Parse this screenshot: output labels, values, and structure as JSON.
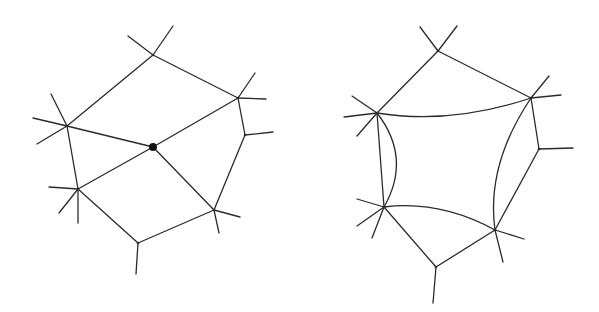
{
  "diagram": {
    "stroke_color": "#2a2a2a",
    "background": "#ffffff",
    "figures": [
      {
        "name": "left-graph",
        "vertices": {
          "top": [
            153,
            55
          ],
          "right_upper": [
            238,
            98
          ],
          "right_mid": [
            245,
            135
          ],
          "center": [
            153,
            147
          ],
          "left_upper": [
            67,
            126
          ],
          "left_lower": [
            78,
            189
          ],
          "bottom_right": [
            214,
            210
          ],
          "bottom": [
            138,
            243
          ]
        },
        "center_dot_radius": 4,
        "edges": [
          [
            "top",
            "right_upper"
          ],
          [
            "top",
            "left_upper"
          ],
          [
            "right_upper",
            "right_mid"
          ],
          [
            "right_mid",
            "bottom_right"
          ],
          [
            "right_upper",
            "center"
          ],
          [
            "left_upper",
            "center"
          ],
          [
            "left_lower",
            "center"
          ],
          [
            "bottom_right",
            "center"
          ],
          [
            "left_upper",
            "left_lower"
          ],
          [
            "left_lower",
            "bottom"
          ],
          [
            "bottom",
            "bottom_right"
          ]
        ],
        "stubs": [
          [
            [
              153,
              55
            ],
            [
              173,
              26
            ]
          ],
          [
            [
              153,
              55
            ],
            [
              128,
              36
            ]
          ],
          [
            [
              238,
              98
            ],
            [
              255,
              73
            ]
          ],
          [
            [
              238,
              98
            ],
            [
              266,
              99
            ]
          ],
          [
            [
              245,
              135
            ],
            [
              273,
              132
            ]
          ],
          [
            [
              67,
              126
            ],
            [
              51,
              94
            ]
          ],
          [
            [
              67,
              126
            ],
            [
              33,
              118
            ]
          ],
          [
            [
              67,
              126
            ],
            [
              37,
              144
            ]
          ],
          [
            [
              78,
              189
            ],
            [
              49,
              187
            ]
          ],
          [
            [
              78,
              189
            ],
            [
              59,
              213
            ]
          ],
          [
            [
              78,
              189
            ],
            [
              78,
              223
            ]
          ],
          [
            [
              214,
              210
            ],
            [
              240,
              217
            ]
          ],
          [
            [
              214,
              210
            ],
            [
              219,
              233
            ]
          ],
          [
            [
              138,
              243
            ],
            [
              136,
              274
            ]
          ]
        ]
      },
      {
        "name": "right-graph",
        "vertices": {
          "top": [
            438,
            51
          ],
          "right_upper": [
            531,
            98
          ],
          "right_mid": [
            539,
            149
          ],
          "left_upper": [
            377,
            113
          ],
          "left_lower": [
            384,
            207
          ],
          "bottom_right": [
            495,
            230
          ],
          "bottom": [
            436,
            267
          ]
        },
        "edges": [
          [
            "top",
            "right_upper"
          ],
          [
            "top",
            "left_upper"
          ],
          [
            "right_upper",
            "right_mid"
          ],
          [
            "right_mid",
            "bottom_right"
          ],
          [
            "left_upper",
            "left_lower"
          ],
          [
            "left_lower",
            "bottom"
          ],
          [
            "bottom",
            "bottom_right"
          ]
        ],
        "curved_edges": [
          {
            "from": "left_upper",
            "to": "right_upper",
            "control": [
              450,
              125
            ]
          },
          {
            "from": "left_upper",
            "to": "left_lower",
            "control": [
              412,
              158
            ]
          },
          {
            "from": "left_lower",
            "to": "bottom_right",
            "control": [
              440,
              200
            ]
          },
          {
            "from": "right_upper",
            "to": "bottom_right",
            "control": [
              486,
              165
            ]
          }
        ],
        "stubs": [
          [
            [
              438,
              51
            ],
            [
              457,
              26
            ]
          ],
          [
            [
              438,
              51
            ],
            [
              420,
              27
            ]
          ],
          [
            [
              531,
              98
            ],
            [
              549,
              76
            ]
          ],
          [
            [
              531,
              98
            ],
            [
              561,
              95
            ]
          ],
          [
            [
              539,
              149
            ],
            [
              573,
              148
            ]
          ],
          [
            [
              377,
              113
            ],
            [
              352,
              96
            ]
          ],
          [
            [
              377,
              113
            ],
            [
              344,
              117
            ]
          ],
          [
            [
              377,
              113
            ],
            [
              357,
              136
            ]
          ],
          [
            [
              384,
              207
            ],
            [
              357,
              199
            ]
          ],
          [
            [
              384,
              207
            ],
            [
              357,
              226
            ]
          ],
          [
            [
              384,
              207
            ],
            [
              372,
              238
            ]
          ],
          [
            [
              495,
              230
            ],
            [
              524,
              239
            ]
          ],
          [
            [
              495,
              230
            ],
            [
              503,
              262
            ]
          ],
          [
            [
              436,
              267
            ],
            [
              433,
              303
            ]
          ]
        ]
      }
    ]
  }
}
